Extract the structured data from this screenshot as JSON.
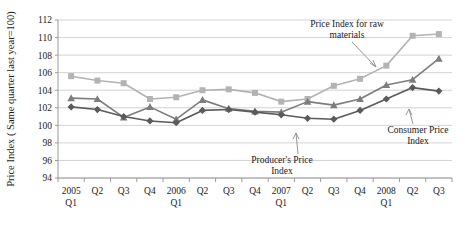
{
  "chart_data": {
    "type": "line",
    "title": "",
    "xlabel": "",
    "ylabel": "Price Index ( Same quarter last year=100)",
    "ylim": [
      94,
      112
    ],
    "yticks": [
      94,
      96,
      98,
      100,
      102,
      104,
      106,
      108,
      110,
      112
    ],
    "grid": true,
    "legend_position": "none (inline annotations with leader lines)",
    "categories": [
      "2005 Q1",
      "Q2",
      "Q3",
      "Q4",
      "2006 Q1",
      "Q2",
      "Q3",
      "Q4",
      "2007 Q1",
      "Q2",
      "Q3",
      "Q4",
      "2008 Q1",
      "Q2",
      "Q3"
    ],
    "x_tick_labels_line1": [
      "2005",
      "Q2",
      "Q3",
      "Q4",
      "2006",
      "Q2",
      "Q3",
      "Q4",
      "2007",
      "Q2",
      "Q3",
      "Q4",
      "2008",
      "Q2",
      "Q3"
    ],
    "x_tick_labels_line2": [
      "Q1",
      "",
      "",
      "",
      "Q1",
      "",
      "",
      "",
      "Q1",
      "",
      "",
      "",
      "Q1",
      "",
      ""
    ],
    "series": [
      {
        "name": "Price Index for raw materials",
        "marker": "square",
        "color": "#b3b3b3",
        "values": [
          105.6,
          105.1,
          104.8,
          103.0,
          103.2,
          104.0,
          104.1,
          103.7,
          102.7,
          103.0,
          104.5,
          105.3,
          106.8,
          110.2,
          110.4
        ]
      },
      {
        "name": "Producer's Price Index",
        "marker": "triangle",
        "color": "#7d7d7d",
        "values": [
          103.1,
          103.0,
          100.9,
          102.1,
          100.7,
          102.9,
          101.9,
          101.6,
          101.5,
          102.7,
          102.3,
          103.0,
          104.6,
          105.2,
          107.6
        ]
      },
      {
        "name": "Consumer Price Index",
        "marker": "diamond",
        "color": "#5a5a5a",
        "values": [
          102.1,
          101.8,
          101.0,
          100.5,
          100.3,
          101.7,
          101.8,
          101.5,
          101.2,
          100.8,
          100.7,
          101.7,
          103.0,
          104.3,
          103.9
        ]
      }
    ],
    "annotations": [
      {
        "id": "raw-materials",
        "line1": "Price Index for raw",
        "line2": "materials",
        "text": "Price Index for raw materials"
      },
      {
        "id": "producers-price-index",
        "line1": "Producer's Price",
        "line2": "Index",
        "text": "Producer's Price Index"
      },
      {
        "id": "consumer-price-index",
        "line1": "Consumer Price",
        "line2": "Index",
        "text": "Consumer Price Index"
      }
    ]
  },
  "colors": {
    "raw_materials": "#b3b3b3",
    "producers": "#7d7d7d",
    "consumer": "#5a5a5a",
    "gridline": "#c8c8c8",
    "axis": "#9a9a9a",
    "text": "#1a1a1a",
    "background": "#ffffff"
  }
}
